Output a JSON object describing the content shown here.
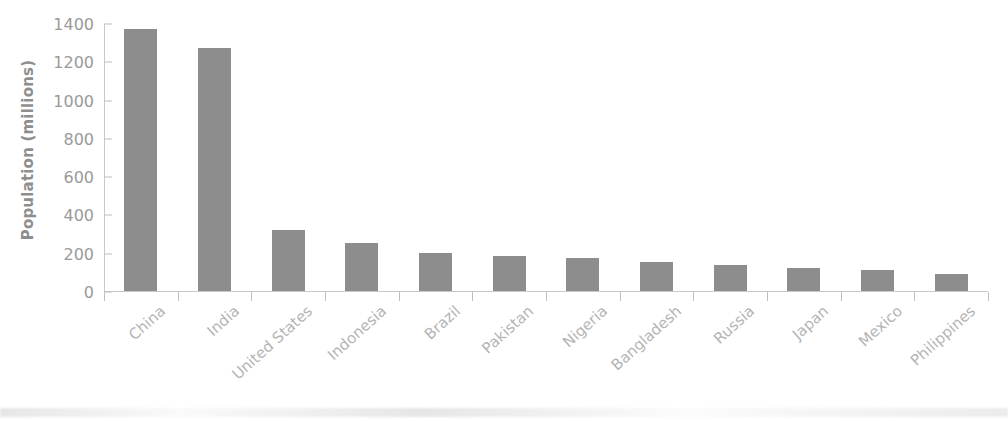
{
  "chart_data": {
    "type": "bar",
    "title": "",
    "xlabel": "",
    "ylabel": "Population (millions)",
    "categories": [
      "China",
      "India",
      "United States",
      "Indonesia",
      "Brazil",
      "Pakistan",
      "Nigeria",
      "Bangladesh",
      "Russia",
      "Japan",
      "Mexico",
      "Philippines"
    ],
    "values": [
      1370,
      1270,
      320,
      250,
      200,
      185,
      175,
      150,
      135,
      120,
      110,
      90
    ],
    "ylim": [
      0,
      1400
    ],
    "yticks": [
      0,
      200,
      400,
      600,
      800,
      1000,
      1200,
      1400
    ],
    "ytick_labels": [
      "0",
      "200",
      "400",
      "600",
      "800",
      "1000",
      "1200",
      "1400"
    ],
    "grid": false,
    "legend": null,
    "bar_color": "#8d8d8d",
    "axis_color": "#c9c9c9",
    "tick_label_color": "#9a9a9a",
    "xtick_label_rotation": -42
  }
}
